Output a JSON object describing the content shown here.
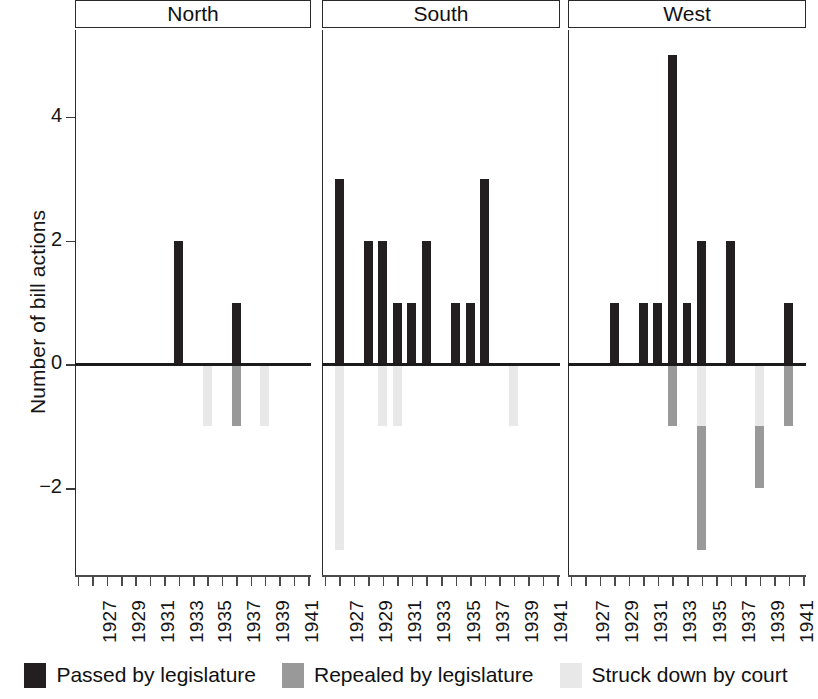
{
  "chart_data": {
    "type": "bar",
    "title": "",
    "xlabel": "",
    "ylabel": "Number of bill actions",
    "ylim": [
      -3.4,
      5.4
    ],
    "xlim": [
      1925.8,
      1942.2
    ],
    "grid": false,
    "stacked": true,
    "panel_variable": "region",
    "panels": [
      "North",
      "South",
      "West"
    ],
    "x": [
      1926,
      1927,
      1928,
      1929,
      1930,
      1931,
      1932,
      1933,
      1934,
      1935,
      1936,
      1937,
      1938,
      1939,
      1940,
      1941,
      1942
    ],
    "tick_labels": [
      "",
      "1927",
      "",
      "1929",
      "",
      "1931",
      "",
      "1933",
      "",
      "1935",
      "",
      "1937",
      "",
      "1939",
      "",
      "1941",
      ""
    ],
    "y_ticks": [
      -2,
      0,
      2,
      4
    ],
    "y_tick_labels": [
      "−2",
      "0",
      "2",
      "4"
    ],
    "series": [
      {
        "name": "Passed by legislature",
        "key": "passed",
        "color": "#231f20"
      },
      {
        "name": "Repealed by legislature",
        "key": "repealed",
        "color": "#999999"
      },
      {
        "name": "Struck down by court",
        "key": "struck",
        "color": "#e8e8e8"
      }
    ],
    "panel_data": {
      "North": {
        "passed": {
          "1933": 2,
          "1937": 1
        },
        "repealed": {
          "1937": -1
        },
        "struck": {
          "1935": -1,
          "1939": -1
        }
      },
      "South": {
        "passed": {
          "1927": 3,
          "1929": 2,
          "1930": 2,
          "1931": 1,
          "1932": 1,
          "1933": 2,
          "1935": 1,
          "1936": 1,
          "1937": 3
        },
        "repealed": {},
        "struck": {
          "1927": -3,
          "1930": -1,
          "1931": -1,
          "1939": -1
        }
      },
      "West": {
        "passed": {
          "1929": 1,
          "1931": 1,
          "1932": 1,
          "1933": 5,
          "1934": 1,
          "1935": 2,
          "1937": 2,
          "1941": 1
        },
        "repealed": {
          "1933": -1,
          "1935": -2,
          "1939": -1,
          "1941": -1
        },
        "struck": {
          "1935": -1,
          "1939": -1
        }
      }
    }
  },
  "legend": {
    "items": [
      {
        "label": "Passed by legislature",
        "color": "#231f20"
      },
      {
        "label": "Repealed by legislature",
        "color": "#999999"
      },
      {
        "label": "Struck down by court",
        "color": "#e8e8e8"
      }
    ]
  },
  "axis": {
    "y_title": "Number of bill actions"
  }
}
